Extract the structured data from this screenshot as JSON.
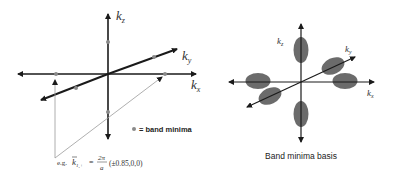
{
  "left_diagram": {
    "axes": {
      "kz_label": "k",
      "kz_sub": "z",
      "ky_label": "k",
      "ky_sub": "y",
      "kx_label": "k",
      "kx_sub": "x"
    },
    "legend": {
      "marker": "dot",
      "text": "= band minima"
    },
    "formula": {
      "prefix": "e.g.",
      "lhs": "k",
      "lhs_sub": "1,+",
      "equals": "=",
      "numerator": "2π",
      "denominator": "a",
      "vector": "(±0.85,0,0)"
    }
  },
  "right_diagram": {
    "axes": {
      "kz_label": "k",
      "kz_sub": "z",
      "ky_label": "k",
      "ky_sub": "y",
      "kx_label": "k",
      "kx_sub": "x"
    },
    "caption": "Band minima basis"
  },
  "colors": {
    "axis": "#1a1a1a",
    "thin_line": "#9a9a9a",
    "dot": "#8a8a8a",
    "ellipse": "#6b6b6b"
  }
}
